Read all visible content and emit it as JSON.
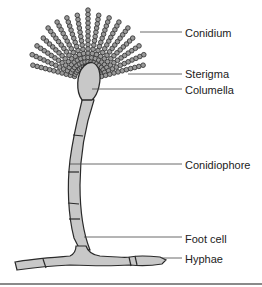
{
  "diagram": {
    "labels": [
      {
        "id": "conidium",
        "text": "Conidium",
        "x": 185,
        "y": 27,
        "line_from": [
          140,
          32
        ],
        "line_to": [
          182,
          32
        ]
      },
      {
        "id": "sterigma",
        "text": "Sterigma",
        "x": 185,
        "y": 68,
        "line_from": [
          128,
          74
        ],
        "line_to": [
          182,
          74
        ]
      },
      {
        "id": "columella",
        "text": "Columella",
        "x": 185,
        "y": 84,
        "line_from": [
          92,
          89
        ],
        "line_to": [
          182,
          89
        ]
      },
      {
        "id": "conidiophore",
        "text": "Conidiophore",
        "x": 185,
        "y": 159,
        "line_from": [
          70,
          164
        ],
        "line_to": [
          182,
          164
        ]
      },
      {
        "id": "foot-cell",
        "text": "Foot cell",
        "x": 185,
        "y": 233,
        "line_from": [
          84,
          237
        ],
        "line_to": [
          182,
          237
        ]
      },
      {
        "id": "hyphae",
        "text": "Hyphae",
        "x": 185,
        "y": 253,
        "line_from": [
          162,
          258
        ],
        "line_to": [
          182,
          258
        ]
      }
    ],
    "colors": {
      "fill": "#c8c8c8",
      "outline": "#2a2a2a",
      "conidia": "#9a9a9a",
      "leader_line": "#444444",
      "rule": "#8a8a8a"
    }
  }
}
